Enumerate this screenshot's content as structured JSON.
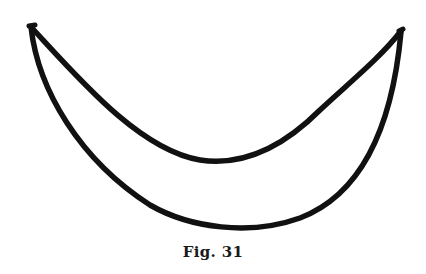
{
  "figure": {
    "caption": "Fig. 31",
    "shape": "crescent",
    "stroke_color": "#111111",
    "background_color": "#ffffff",
    "left_tip": [
      31,
      27
    ],
    "right_tip": [
      401,
      30
    ],
    "inner_curve_low_point": [
      230,
      162
    ],
    "outer_curve_low_point": [
      230,
      231
    ]
  }
}
